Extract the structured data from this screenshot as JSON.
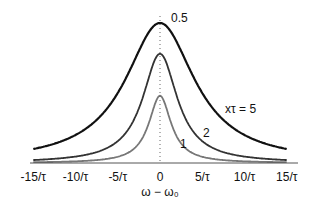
{
  "chart_data": {
    "type": "line",
    "title": "",
    "xlabel": "ω − ω₀",
    "ylabel": "",
    "x_ticks": [
      "-15/τ",
      "-10/τ",
      "-5/τ",
      "0",
      "5/τ",
      "10/τ",
      "15/τ"
    ],
    "x_tick_values": [
      -15,
      -10,
      -5,
      0,
      5,
      10,
      15
    ],
    "xlim": [
      -15,
      15
    ],
    "grid": false,
    "legend": "inline labels",
    "annotations": [
      "0.5",
      "xτ = 5",
      "2",
      "1"
    ],
    "series": [
      {
        "name": "xτ = 5",
        "peak": 0.5,
        "half_width": 5.0,
        "color": "#111111"
      },
      {
        "name": "2",
        "peak": 0.39,
        "half_width": 2.5,
        "color": "#333333"
      },
      {
        "name": "1",
        "peak": 0.24,
        "half_width": 1.6,
        "color": "#777777"
      }
    ]
  },
  "labels": {
    "peak": "0.5",
    "curve5": "xτ = 5",
    "curve2": "2",
    "curve1": "1",
    "xlabel": "ω − ω₀",
    "ticks": [
      "-15/τ",
      "-10/τ",
      "-5/τ",
      "0",
      "5/τ",
      "10/τ",
      "15/τ"
    ]
  }
}
